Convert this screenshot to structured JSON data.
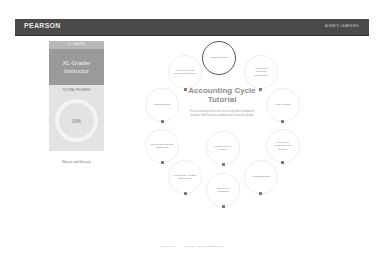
{
  "header": {
    "brand": "PEARSON",
    "tagline": "ALWAYS LEARNING"
  },
  "left_panel": {
    "label": "XL-GRADER",
    "course_title": "XL-Grader Instructor",
    "progress_title": "TUTORIAL PROGRESS",
    "progress_value": "0%",
    "glossary_link": "Manual and Glossary"
  },
  "main": {
    "title": "Accounting Cycle Tutorial",
    "description": "The accounting cycle is the process by which companies produce their financial statements for a specific period.",
    "nodes": [
      {
        "label": "Account Balances",
        "active": true
      },
      {
        "label": "Analyze and Journalize Transactions",
        "active": false
      },
      {
        "label": "Post to Ledger",
        "active": false
      },
      {
        "label": "Prepare the Unadjusted Trial Balance",
        "active": false
      },
      {
        "label": "Adjusting Entries",
        "active": false
      },
      {
        "label": "Prepare the Worksheet",
        "active": false
      },
      {
        "label": "Prepare the Adjusted Trial Balance",
        "active": false
      },
      {
        "label": "Prepare the Financial Statements",
        "active": false
      },
      {
        "label": "Closing Entries",
        "active": false
      },
      {
        "label": "Prepare the Post-Closing Trial Balance",
        "active": false
      },
      {
        "label": "Comprehensive Problem",
        "active": false
      }
    ]
  },
  "footer": {
    "links": [
      "Privacy Policy",
      "Copyright © 2015 Pearson Education"
    ]
  }
}
